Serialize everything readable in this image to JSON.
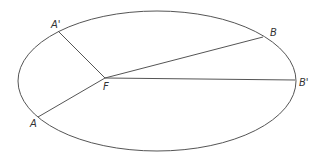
{
  "diagram": {
    "ellipse": {
      "cx": 157,
      "cy": 81,
      "rx": 139,
      "ry": 70
    },
    "focus": {
      "label": "F",
      "x": 105,
      "y": 78
    },
    "points": [
      {
        "label": "A'",
        "x": 58,
        "y": 31
      },
      {
        "label": "A",
        "x": 38,
        "y": 117
      },
      {
        "label": "B",
        "x": 263,
        "y": 37
      },
      {
        "label": "B'",
        "x": 295,
        "y": 80
      }
    ],
    "labels": {
      "a_prime": "A'",
      "a": "A",
      "b": "B",
      "b_prime": "B'",
      "f": "F"
    }
  }
}
